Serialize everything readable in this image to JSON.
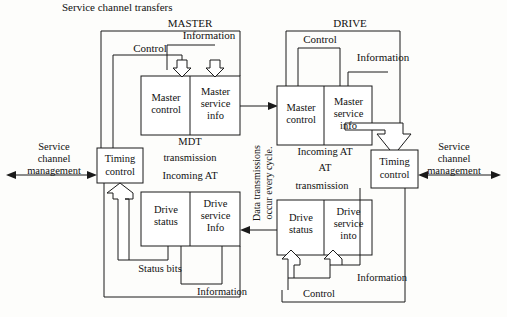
{
  "diagram": {
    "title_top_left": "Service channel transfers",
    "master": {
      "section_label": "MASTER",
      "control_label": "Control",
      "information_label": "Information",
      "upper_box": {
        "left_cell": "Master\ncontrol",
        "right_cell": "Master\nservice\ninfo",
        "left_line1": "Master",
        "left_line2": "control",
        "right_line1": "Master",
        "right_line2": "service",
        "right_line3": "info"
      },
      "mid_label_line1": "MDT",
      "mid_label_line2": "transmission",
      "mid_label_line3": "Incoming AT",
      "lower_box": {
        "left_line1": "Drive",
        "left_line2": "status",
        "right_line1": "Drive",
        "right_line2": "service",
        "right_line3": "Info"
      },
      "timing_line1": "Timing",
      "timing_line2": "control",
      "status_bits_label": "Status bits",
      "information_bottom_label": "Information",
      "service_mgmt_line1": "Service",
      "service_mgmt_line2": "channel",
      "service_mgmt_line3": "management"
    },
    "drive": {
      "section_label": "DRIVE",
      "control_label": "Control",
      "information_label": "Information",
      "upper_box": {
        "left_line1": "Master",
        "left_line2": "control",
        "right_line1": "Master",
        "right_line2": "service",
        "right_line3": "info"
      },
      "mid_label_line1": "Incoming AT",
      "mid_label_line2": "AT",
      "mid_label_line3": "transmission",
      "lower_box": {
        "left_line1": "Drive",
        "left_line2": "status",
        "right_line1": "Drive",
        "right_line2": "service",
        "right_line3": "into"
      },
      "timing_line1": "Timing",
      "timing_line2": "control",
      "control_bottom_label": "Control",
      "information_bottom_label": "Information",
      "service_mgmt_line1": "Service",
      "service_mgmt_line2": "channel",
      "service_mgmt_line3": "management"
    },
    "center_note_line1": "Data transmissions",
    "center_note_line2": "occur every cycle.",
    "colors": {
      "stroke": "#1a1a1a",
      "fill": "#ffffff",
      "background": "#fdfdfb",
      "text": "#111111"
    }
  }
}
